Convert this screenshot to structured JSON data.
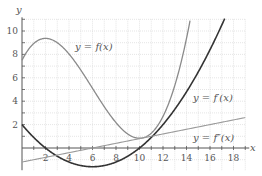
{
  "chart_data": {
    "type": "line",
    "title": "",
    "xlabel": "x",
    "ylabel": "y",
    "xlim": [
      0,
      19
    ],
    "ylim": [
      -2,
      11
    ],
    "grid": true,
    "x_ticks": [
      2,
      4,
      6,
      8,
      10,
      12,
      14,
      16,
      18
    ],
    "y_ticks": [
      2,
      4,
      6,
      8,
      10
    ],
    "x_tick_labels": [
      "2",
      "4",
      "6",
      "8",
      "10",
      "12",
      "14",
      "16",
      "18"
    ],
    "y_tick_labels": [
      "2",
      "4",
      "6",
      "8",
      "10"
    ],
    "series": [
      {
        "name": "y = f(x)",
        "color": "#8a8a8a",
        "formula": "x^3/30 - 0.6x^2 + 2x + 7.5",
        "x": [
          0,
          1,
          2,
          3,
          4,
          5,
          6,
          7,
          8,
          9,
          10,
          11,
          12,
          13,
          14,
          15
        ],
        "values": [
          7.5,
          8.93,
          9.37,
          9.0,
          8.03,
          6.67,
          5.1,
          3.53,
          2.17,
          1.2,
          0.83,
          1.27,
          2.7,
          5.33,
          9.37,
          15.0
        ]
      },
      {
        "name": "y = f'(x)",
        "color": "#333333",
        "formula": "(x-2)(x-10)/10",
        "x": [
          0,
          1,
          2,
          3,
          4,
          5,
          6,
          7,
          8,
          9,
          10,
          11,
          12,
          13,
          14,
          15,
          16,
          17,
          18
        ],
        "values": [
          2.0,
          0.9,
          0.0,
          -0.7,
          -1.2,
          -1.5,
          -1.6,
          -1.5,
          -1.2,
          -0.7,
          0.0,
          0.9,
          2.0,
          3.3,
          4.8,
          6.5,
          8.4,
          10.5,
          12.8
        ]
      },
      {
        "name": "y = f''(x)",
        "color": "#9a9a9a",
        "formula": "0.2x - 1.2",
        "x": [
          0,
          19
        ],
        "values": [
          -1.2,
          2.6
        ]
      }
    ],
    "annotations": [
      {
        "text": "y = f(x)",
        "x": 4.5,
        "y": 8.5
      },
      {
        "text": "y = f'(x)",
        "x": 14.6,
        "y": 4.3
      },
      {
        "text": "y = f''(x)",
        "x": 14.6,
        "y": 0.9
      }
    ]
  },
  "labels": {
    "x_axis": "x",
    "y_axis": "y",
    "f": "y = f(x)",
    "fprime": "y = f′(x)",
    "fdprime": "y = f″(x)"
  }
}
